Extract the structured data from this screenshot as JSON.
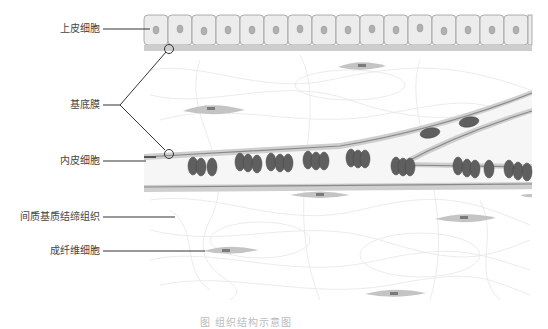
{
  "diagram": {
    "title_fragment": "",
    "caption": "图 组织结构示意图",
    "labels": [
      {
        "id": "epithelial",
        "text": "上皮细胞"
      },
      {
        "id": "basement",
        "text": "基底膜"
      },
      {
        "id": "endothelial",
        "text": "内皮细胞"
      },
      {
        "id": "interstitial",
        "text": "间质基质结缔组织"
      },
      {
        "id": "fibroblast",
        "text": "成纤维细胞"
      }
    ],
    "colors": {
      "cell_fill": "#ececec",
      "cell_border": "#9a9a9a",
      "nucleus": "#a8a8a8",
      "membrane": "#c9c9c9",
      "vessel_wall": "#8a8a8a",
      "vessel_wall_light": "#cfcfcf",
      "rbc": "#5f5f5f",
      "fibroblast": "#c2c2c2",
      "fibroblast_nucleus": "#7a7a7a",
      "fiber": "#e4e4e4",
      "leader_line": "#333333"
    }
  }
}
